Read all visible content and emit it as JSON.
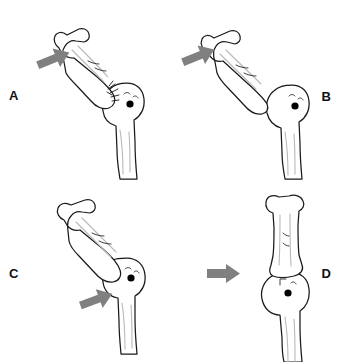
{
  "figure": {
    "background_color": "#ffffff",
    "outline_color": "#1a1a1a",
    "arrow_color": "#808080",
    "marker_color": "#000000",
    "shade_color": "#b9b9b9",
    "panel_count": 4
  },
  "panels": [
    {
      "id": "a",
      "label": "A",
      "label_side": "left",
      "arrow": {
        "name": "force-arrow-diagonal-up-right",
        "direction": "up-right",
        "angle_deg": -22,
        "color": "#808080"
      },
      "bones": {
        "shaft": {
          "name": "angulated-long-bone",
          "orientation": "oblique-up-left",
          "has_shading": true
        },
        "head": {
          "name": "articular-head",
          "orientation": "vertical",
          "has_marker": true,
          "has_crepitus": true
        }
      },
      "marker": {
        "name": "joint-center-dot",
        "color": "#000000"
      }
    },
    {
      "id": "b",
      "label": "B",
      "label_side": "right",
      "arrow": {
        "name": "force-arrow-diagonal-up-right",
        "direction": "up-right",
        "angle_deg": -22,
        "color": "#808080"
      },
      "bones": {
        "shaft": {
          "name": "angulated-long-bone",
          "orientation": "oblique-up-left",
          "has_shading": true
        },
        "head": {
          "name": "articular-head",
          "orientation": "vertical",
          "has_marker": true,
          "has_crepitus": false
        }
      },
      "marker": {
        "name": "joint-center-dot",
        "color": "#000000"
      }
    },
    {
      "id": "c",
      "label": "C",
      "label_side": "left",
      "arrow": {
        "name": "force-arrow-diagonal-up-right",
        "direction": "up-right",
        "angle_deg": -20,
        "color": "#808080"
      },
      "bones": {
        "shaft": {
          "name": "angulated-long-bone",
          "orientation": "oblique-up-left",
          "has_shading": true
        },
        "head": {
          "name": "articular-head",
          "orientation": "vertical",
          "has_marker": true,
          "has_crepitus": false
        }
      },
      "marker": {
        "name": "joint-center-dot",
        "color": "#000000"
      }
    },
    {
      "id": "d",
      "label": "D",
      "label_side": "right",
      "arrow": {
        "name": "force-arrow-horizontal-right",
        "direction": "right",
        "angle_deg": 0,
        "color": "#808080"
      },
      "bones": {
        "shaft": {
          "name": "aligned-long-bone",
          "orientation": "vertical",
          "has_shading": true
        },
        "head": {
          "name": "articular-head",
          "orientation": "vertical",
          "has_marker": true,
          "has_crepitus": false
        }
      },
      "marker": {
        "name": "joint-center-dot",
        "color": "#000000"
      }
    }
  ]
}
